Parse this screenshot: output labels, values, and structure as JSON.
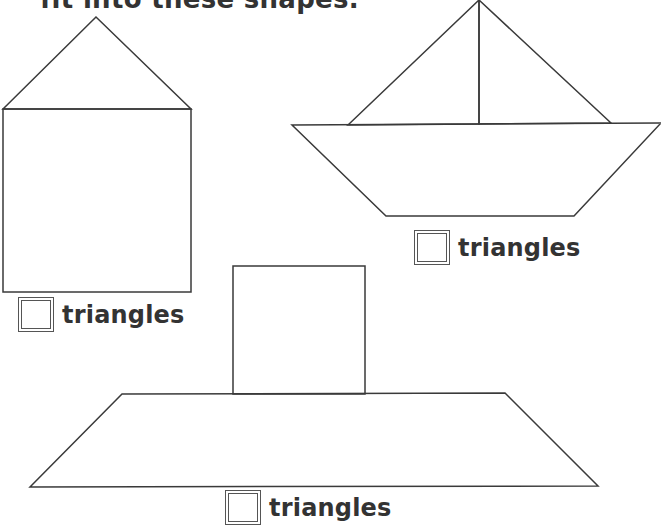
{
  "header": {
    "title": "fit into these shapes."
  },
  "shapes": [
    {
      "name": "house",
      "answer_label": "triangles",
      "answer_value": ""
    },
    {
      "name": "sailboat",
      "answer_label": "triangles",
      "answer_value": ""
    },
    {
      "name": "ship",
      "answer_label": "triangles",
      "answer_value": ""
    }
  ],
  "colors": {
    "line": "#3a3a3a",
    "text": "#333333",
    "background": "#ffffff"
  }
}
